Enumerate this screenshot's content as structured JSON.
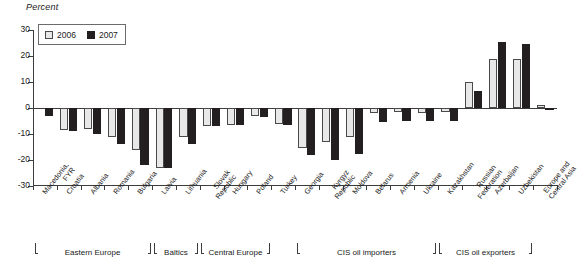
{
  "chart_data": {
    "type": "bar",
    "title": "Percent",
    "xlabel": "",
    "ylabel": "Percent",
    "ylim": [
      -30,
      30
    ],
    "yticks": [
      30,
      20,
      10,
      0,
      -10,
      -20,
      -30
    ],
    "ytick_labels": [
      "30",
      "20",
      "10",
      "0",
      "-10",
      "-20",
      "-30"
    ],
    "grid": false,
    "legend_position": "top-left",
    "categories": [
      "Macedonia, FYR",
      "Croatia",
      "Albania",
      "Romania",
      "Bulgaria",
      "Latvia",
      "Lithuania",
      "Slovak Republic",
      "Hungary",
      "Poland",
      "Turkey",
      "Georgia",
      "Kyrgyz Republic",
      "Moldova",
      "Belarus",
      "Armenia",
      "Ukraine",
      "Kazakhstan",
      "Russian Federation",
      "Azerbaijan",
      "Uzbekistan",
      "Europe and Central Asia"
    ],
    "category_lines": [
      [
        "Macedonia,",
        "FYR"
      ],
      [
        "Croatia"
      ],
      [
        "Albania"
      ],
      [
        "Romania"
      ],
      [
        "Bulgaria"
      ],
      [
        "Latvia"
      ],
      [
        "Lithuania"
      ],
      [
        "Slovak",
        "Republic"
      ],
      [
        "Hungary"
      ],
      [
        "Poland"
      ],
      [
        "Turkey"
      ],
      [
        "Georgia"
      ],
      [
        "Kyrgyz",
        "Republic"
      ],
      [
        "Moldova"
      ],
      [
        "Belarus"
      ],
      [
        "Armenia"
      ],
      [
        "Ukraine"
      ],
      [
        "Kazakhstan"
      ],
      [
        "Russian",
        "Federation"
      ],
      [
        "Azerbaijan"
      ],
      [
        "Uzbekistan"
      ],
      [
        "Europe and",
        "Central Asia"
      ]
    ],
    "series": [
      {
        "name": "2006",
        "color": "#e8e8e8",
        "values": [
          0,
          -8.5,
          -8.0,
          -11.0,
          -16.0,
          -23.0,
          -11.0,
          -7.0,
          -6.5,
          -3.0,
          -6.0,
          -15.5,
          -13.0,
          -11.0,
          -2.0,
          -1.5,
          -2.0,
          -1.5,
          10.0,
          19.0,
          19.0,
          1.0
        ]
      },
      {
        "name": "2007",
        "color": "#231f20",
        "values": [
          -3.0,
          -9.0,
          -10.0,
          -14.0,
          -22.0,
          -23.0,
          -14.0,
          -7.0,
          -6.5,
          -3.5,
          -6.5,
          -18.0,
          -20.0,
          -17.5,
          -5.5,
          -5.0,
          -5.0,
          -5.0,
          6.5,
          25.5,
          24.5,
          -0.5
        ]
      }
    ],
    "region_groups": [
      {
        "label": "Eastern Europe",
        "start_index": 0,
        "end_index": 4
      },
      {
        "label": "Baltics",
        "start_index": 5,
        "end_index": 6
      },
      {
        "label": "Central Europe",
        "start_index": 7,
        "end_index": 9
      },
      {
        "label": "CIS oil importers",
        "start_index": 11,
        "end_index": 16
      },
      {
        "label": "CIS oil exporters",
        "start_index": 17,
        "end_index": 20
      }
    ]
  },
  "legend": {
    "items": [
      {
        "label": "2006",
        "key": "y2006"
      },
      {
        "label": "2007",
        "key": "y2007"
      }
    ]
  }
}
